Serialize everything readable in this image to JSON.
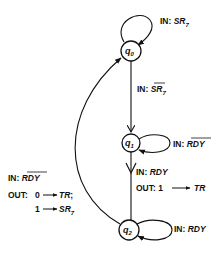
{
  "diagram": {
    "type": "state-machine",
    "states": [
      {
        "id": "q0",
        "name": "q",
        "sub": "0"
      },
      {
        "id": "q1",
        "name": "q",
        "sub": "1"
      },
      {
        "id": "q2",
        "name": "q",
        "sub": "2"
      }
    ],
    "transitions": {
      "q0_self": {
        "prefix": "IN: ",
        "signal": "SR",
        "sub": "7",
        "overbar": false
      },
      "q0_to_q1": {
        "prefix": "IN: ",
        "signal": "SR",
        "sub": "7",
        "overbar": true
      },
      "q1_self": {
        "prefix": "IN: ",
        "signal": "RDY",
        "overbar": true
      },
      "q1_to_q2": {
        "prefix": "IN: ",
        "signal": "RDY",
        "overbar": false,
        "out_prefix": "OUT: 1",
        "out_arrow": "→",
        "out_signal": "TR"
      },
      "q2_self": {
        "prefix": "IN: ",
        "signal": "RDY",
        "overbar": false
      },
      "q2_to_q0": {
        "prefix": "IN: ",
        "signal": "RDY",
        "overbar": true,
        "out_prefix": "OUT:",
        "out_line1_value": "0",
        "out_line1_signal": "TR",
        "out_line1_suffix": ";",
        "out_line2_value": "1",
        "out_line2_signal": "SR",
        "out_line2_sub": "7"
      }
    },
    "colors": {
      "stroke": "#111111",
      "background": "#ffffff"
    }
  }
}
